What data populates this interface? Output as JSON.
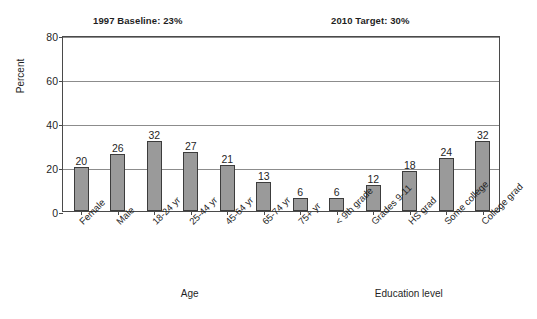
{
  "chart_data": {
    "type": "bar",
    "title": "",
    "xlabel": "",
    "ylabel": "Percent",
    "ylim": [
      0,
      80
    ],
    "yticks": [
      0,
      20,
      40,
      60,
      80
    ],
    "grid": true,
    "legend": "none",
    "categories": [
      "Female",
      "Male",
      "18-24 yr",
      "25-44 yr",
      "45-64 yr",
      "65-74 yr",
      "75+ yr",
      "< 9th grade",
      "Grades 9-11",
      "HS grad",
      "Some college",
      "College grad"
    ],
    "values": [
      20,
      26,
      32,
      27,
      21,
      13,
      6,
      6,
      12,
      18,
      24,
      32
    ],
    "bar_color": "#9a9a9a",
    "bar_edge_color": "#3c3c3c",
    "groups": [
      {
        "label": "Age",
        "center_index": 3.5
      },
      {
        "label": "Education level",
        "center_index": 9.5
      }
    ],
    "annotations": [
      {
        "name": "baseline",
        "text": "1997 Baseline: 23%"
      },
      {
        "name": "target",
        "text": "2010 Target: 30%"
      }
    ]
  }
}
